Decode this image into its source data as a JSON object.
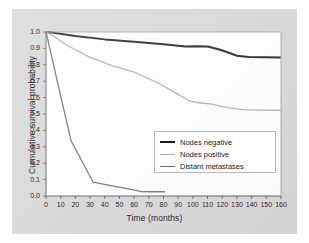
{
  "figure": {
    "background_color": "#d6d6d6",
    "plot_background_color": "#ffffff",
    "frame_color": "#8c8c8c"
  },
  "chart_data": {
    "type": "line",
    "title": "",
    "subtitle": "",
    "xlabel": "Time (months)",
    "ylabel": "Cumulative survival probability",
    "xlim": [
      0,
      160
    ],
    "ylim": [
      0.0,
      1.0
    ],
    "xticks": [
      0,
      10,
      20,
      30,
      40,
      50,
      60,
      70,
      80,
      90,
      100,
      110,
      120,
      130,
      140,
      150,
      160
    ],
    "yticks": [
      0.0,
      0.1,
      0.2,
      0.3,
      0.4,
      0.5,
      0.6,
      0.7,
      0.8,
      0.9,
      1.0
    ],
    "xtick_labels": [
      "0",
      "10",
      "20",
      "30",
      "40",
      "50",
      "60",
      "70",
      "80",
      "90",
      "100",
      "110",
      "120",
      "130",
      "140",
      "150",
      "160"
    ],
    "ytick_labels": [
      "0.0",
      "0.1",
      "0.2",
      "0.3",
      "0.4",
      "0.5",
      "0.6",
      "0.7",
      "0.8",
      "0.9",
      "1.0"
    ],
    "grid": false,
    "legend_position": "lower right",
    "series": [
      {
        "name": "Nodes negative",
        "color": "#1a1a1a",
        "width": 2.0,
        "x": [
          0,
          5,
          20,
          40,
          60,
          80,
          95,
          103,
          110,
          118,
          125,
          130,
          138,
          148,
          160
        ],
        "y": [
          1.0,
          0.995,
          0.975,
          0.955,
          0.94,
          0.925,
          0.912,
          0.913,
          0.912,
          0.893,
          0.872,
          0.855,
          0.848,
          0.846,
          0.845
        ]
      },
      {
        "name": "Nodes positive",
        "color": "#adadad",
        "width": 1.3,
        "x": [
          0,
          5,
          15,
          30,
          45,
          60,
          75,
          88,
          98,
          105,
          112,
          120,
          128,
          134,
          145,
          160
        ],
        "y": [
          1.0,
          0.975,
          0.915,
          0.845,
          0.795,
          0.755,
          0.695,
          0.63,
          0.578,
          0.567,
          0.562,
          0.545,
          0.533,
          0.527,
          0.524,
          0.523
        ]
      },
      {
        "name": "Distant metastases",
        "color": "#6e6e6e",
        "width": 1.3,
        "x": [
          0,
          17,
          32,
          45,
          58,
          65,
          73,
          81
        ],
        "y": [
          1.0,
          0.338,
          0.085,
          0.062,
          0.04,
          0.027,
          0.026,
          0.026
        ]
      }
    ]
  },
  "legend": {
    "items": [
      {
        "label": "Nodes negative",
        "color": "#1a1a1a",
        "width": "2px"
      },
      {
        "label": "Nodes positive",
        "color": "#adadad",
        "width": "1.5px"
      },
      {
        "label": "Distant metastases",
        "color": "#6e6e6e",
        "width": "1.5px"
      }
    ]
  }
}
